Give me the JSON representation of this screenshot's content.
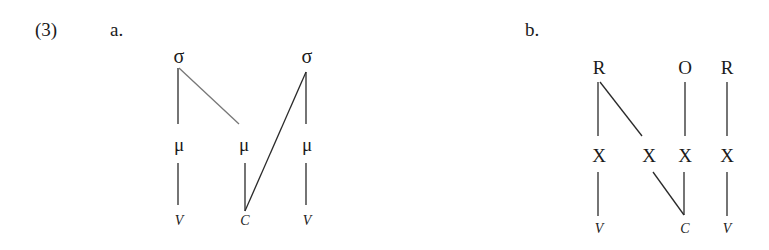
{
  "example_number": "(3)",
  "panels": [
    {
      "label": "a.",
      "tiers": {
        "top": [
          "σ",
          "σ"
        ],
        "middle": [
          "μ",
          "μ",
          "μ"
        ],
        "bottom": [
          "V",
          "C",
          "V"
        ]
      },
      "associations": [
        [
          "σ1",
          "μ1"
        ],
        [
          "σ1",
          "μ2"
        ],
        [
          "σ2",
          "μ3"
        ],
        [
          "σ2",
          "C"
        ],
        [
          "μ1",
          "V1"
        ],
        [
          "μ2",
          "C"
        ],
        [
          "μ3",
          "V2"
        ]
      ]
    },
    {
      "label": "b.",
      "tiers": {
        "top": [
          "R",
          "O",
          "R"
        ],
        "middle": [
          "X",
          "X",
          "X",
          "X"
        ],
        "bottom": [
          "V",
          "C",
          "V"
        ]
      },
      "associations": [
        [
          "R1",
          "X1"
        ],
        [
          "R1",
          "X2"
        ],
        [
          "O",
          "X3"
        ],
        [
          "R2",
          "X4"
        ],
        [
          "X1",
          "V1"
        ],
        [
          "X2",
          "C"
        ],
        [
          "X3",
          "C"
        ],
        [
          "X4",
          "V2"
        ]
      ]
    }
  ]
}
